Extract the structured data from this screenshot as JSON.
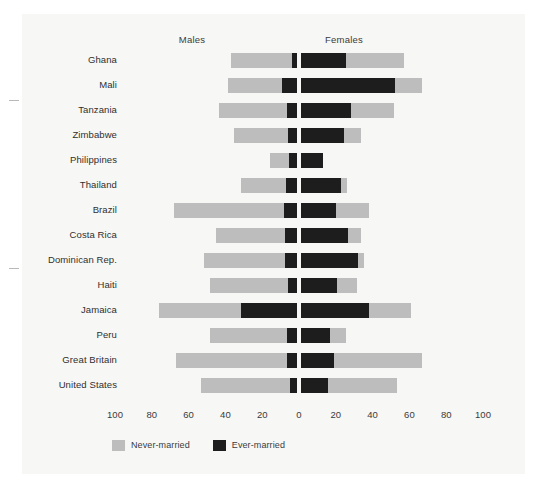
{
  "chart_data": {
    "type": "bar",
    "subtype": "population-pyramid-stacked",
    "title": "",
    "xlabel": "",
    "ylabel": "",
    "grid": false,
    "legend_position": "bottom-left",
    "panel_headers": [
      "Males",
      "Females"
    ],
    "axis": {
      "tick_labels": [
        "100",
        "80",
        "60",
        "40",
        "20",
        "0",
        "20",
        "40",
        "60",
        "80",
        "100"
      ],
      "tick_values": [
        -100,
        -80,
        -60,
        -40,
        -20,
        0,
        20,
        40,
        60,
        80,
        100
      ],
      "xlim": [
        -100,
        100
      ],
      "center_value": 0,
      "units": "percent"
    },
    "legend": [
      {
        "name": "Never-married",
        "color": "#bdbdbd"
      },
      {
        "name": "Ever-married",
        "color": "#1d1d1d"
      }
    ],
    "categories": [
      "Ghana",
      "Mali",
      "Tanzania",
      "Zimbabwe",
      "Philippines",
      "Thailand",
      "Brazil",
      "Costa Rica",
      "Dominican Rep.",
      "Haiti",
      "Jamaica",
      "Peru",
      "Great Britain",
      "United States"
    ],
    "series": [
      {
        "name": "Males Ever-married",
        "side": "left",
        "color": "#1d1d1d",
        "values": [
          2.7,
          8.0,
          5.4,
          4.9,
          4.5,
          5.8,
          7.0,
          6.5,
          6.5,
          4.8,
          30.6,
          5.5,
          5.5,
          4.0
        ]
      },
      {
        "name": "Males Never-married",
        "side": "left",
        "color": "#bdbdbd",
        "values": [
          33.3,
          29.5,
          37.1,
          29.1,
          10.0,
          24.8,
          60.0,
          37.4,
          44.0,
          42.7,
          44.4,
          42.0,
          60.0,
          48.0
        ]
      },
      {
        "name": "Females Ever-married",
        "side": "right",
        "color": "#1d1d1d",
        "values": [
          24.6,
          51.0,
          27.0,
          23.5,
          11.8,
          21.5,
          19.0,
          25.5,
          31.0,
          19.5,
          36.8,
          15.5,
          18.0,
          14.5
        ]
      },
      {
        "name": "Females Never-married",
        "side": "right",
        "color": "#bdbdbd",
        "values": [
          31.4,
          15.0,
          23.7,
          9.1,
          0.0,
          3.5,
          18.0,
          7.0,
          3.5,
          11.0,
          23.2,
          9.0,
          48.0,
          37.5
        ]
      }
    ]
  }
}
